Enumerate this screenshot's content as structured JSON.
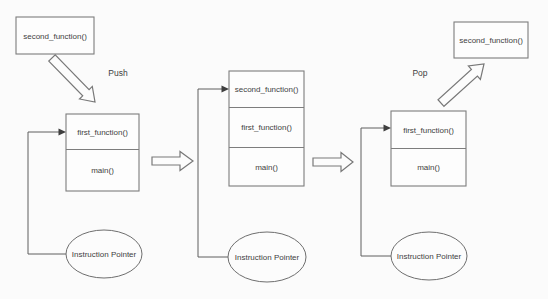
{
  "diagram_type": "call-stack-push-pop",
  "labels": {
    "push": "Push",
    "pop": "Pop",
    "instruction_pointer": "Instruction Pointer"
  },
  "stage1": {
    "floating_box": "second_function()",
    "operation": "Push",
    "stack": [
      "first_function()",
      "main()"
    ]
  },
  "stage2": {
    "stack": [
      "second_function()",
      "first_function()",
      "main()"
    ]
  },
  "stage3": {
    "floating_box": "second_function()",
    "operation": "Pop",
    "stack": [
      "first_function()",
      "main()"
    ]
  },
  "colors": {
    "background": "#fbfbfb",
    "box_stroke": "#7d7d7d",
    "connector_stroke": "#5e5e5e",
    "text": "#3f3f3f",
    "arrow_fill": "#fcfcfc"
  }
}
